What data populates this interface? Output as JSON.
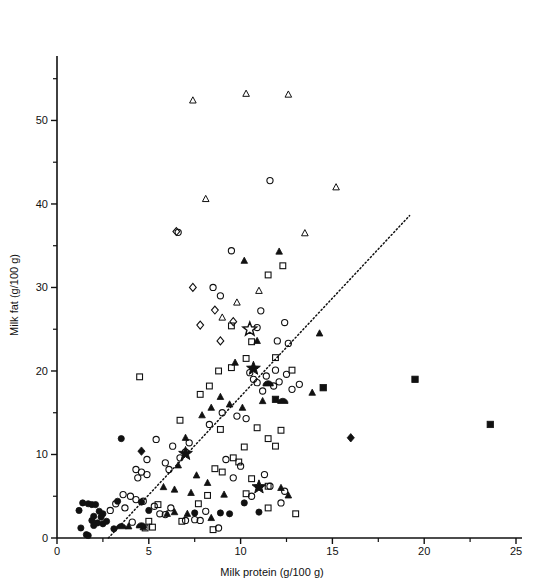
{
  "chart_data": {
    "type": "scatter",
    "title": "",
    "xlabel": "Milk protein (g/100 g)",
    "ylabel": "Milk fat (g/100 g)",
    "xlim": [
      0,
      25
    ],
    "ylim": [
      0,
      57
    ],
    "xticks_major": [
      0,
      5,
      10,
      15,
      20,
      25
    ],
    "xticks_minor": [
      2.5,
      7.5,
      12.5,
      17.5,
      22.5
    ],
    "yticks_major": [
      0,
      10,
      20,
      30,
      40,
      50
    ],
    "yticks_minor": [
      5,
      15,
      25,
      35,
      45,
      55
    ],
    "grid": false,
    "legend": false,
    "annotations": [
      {
        "type": "dotted-line",
        "x1": 2.8,
        "y1": 0.0,
        "x2": 19.2,
        "y2": 38.6
      }
    ],
    "marker_types": [
      "open-circle",
      "filled-circle",
      "open-triangle",
      "filled-triangle",
      "open-square",
      "filled-square",
      "open-diamond",
      "filled-diamond",
      "open-star",
      "filled-star",
      "half-filled-circle"
    ],
    "series": [
      {
        "name": "open-circle",
        "marker": "open-circle",
        "points": [
          [
            11.6,
            42.8
          ],
          [
            9.5,
            34.4
          ],
          [
            6.6,
            36.6
          ],
          [
            11.1,
            27.2
          ],
          [
            12.4,
            25.8
          ],
          [
            8.5,
            30.0
          ],
          [
            8.9,
            29.0
          ],
          [
            12.0,
            23.6
          ],
          [
            12.6,
            23.3
          ],
          [
            10.9,
            25.2
          ],
          [
            11.9,
            20.1
          ],
          [
            12.5,
            19.6
          ],
          [
            12.1,
            18.7
          ],
          [
            11.4,
            19.4
          ],
          [
            11.8,
            18.2
          ],
          [
            13.2,
            18.4
          ],
          [
            12.8,
            17.8
          ],
          [
            10.5,
            19.8
          ],
          [
            10.7,
            19.0
          ],
          [
            10.9,
            18.6
          ],
          [
            11.2,
            17.6
          ],
          [
            9.0,
            15.0
          ],
          [
            9.8,
            14.6
          ],
          [
            8.3,
            13.6
          ],
          [
            10.3,
            14.3
          ],
          [
            7.2,
            11.4
          ],
          [
            6.3,
            11.0
          ],
          [
            7.0,
            10.3
          ],
          [
            6.7,
            9.6
          ],
          [
            5.4,
            11.8
          ],
          [
            4.9,
            9.4
          ],
          [
            5.9,
            9.0
          ],
          [
            6.1,
            8.2
          ],
          [
            4.3,
            8.2
          ],
          [
            4.6,
            7.9
          ],
          [
            4.9,
            7.6
          ],
          [
            4.4,
            7.2
          ],
          [
            9.2,
            9.4
          ],
          [
            10.0,
            8.6
          ],
          [
            9.6,
            7.2
          ],
          [
            11.3,
            7.6
          ],
          [
            11.6,
            6.2
          ],
          [
            10.6,
            5.0
          ],
          [
            12.4,
            5.6
          ],
          [
            3.6,
            5.2
          ],
          [
            4.0,
            5.0
          ],
          [
            4.3,
            4.6
          ],
          [
            4.7,
            4.4
          ],
          [
            3.2,
            4.1
          ],
          [
            3.7,
            3.6
          ],
          [
            2.9,
            3.3
          ],
          [
            5.3,
            3.8
          ],
          [
            6.2,
            3.6
          ],
          [
            7.0,
            2.1
          ],
          [
            7.5,
            2.2
          ],
          [
            7.8,
            2.1
          ],
          [
            5.6,
            2.9
          ],
          [
            5.9,
            2.8
          ],
          [
            8.1,
            3.2
          ],
          [
            12.2,
            4.2
          ],
          [
            4.1,
            1.9
          ],
          [
            8.8,
            1.2
          ]
        ]
      },
      {
        "name": "filled-circle",
        "marker": "filled-circle",
        "points": [
          [
            3.5,
            11.9
          ],
          [
            1.4,
            4.2
          ],
          [
            1.7,
            4.1
          ],
          [
            1.9,
            4.0
          ],
          [
            2.1,
            4.0
          ],
          [
            1.2,
            3.3
          ],
          [
            2.3,
            3.2
          ],
          [
            2.5,
            2.9
          ],
          [
            2.4,
            2.5
          ],
          [
            1.9,
            2.1
          ],
          [
            2.2,
            1.8
          ],
          [
            2.5,
            1.7
          ],
          [
            2.0,
            1.5
          ],
          [
            1.3,
            1.2
          ],
          [
            1.6,
            0.4
          ],
          [
            1.7,
            0.3
          ],
          [
            3.1,
            1.1
          ],
          [
            3.3,
            4.4
          ],
          [
            4.6,
            4.3
          ],
          [
            5.0,
            3.3
          ],
          [
            7.5,
            3.0
          ],
          [
            8.9,
            3.0
          ],
          [
            9.4,
            2.9
          ],
          [
            10.2,
            4.2
          ],
          [
            11.0,
            3.1
          ],
          [
            2.0,
            2.6
          ],
          [
            2.7,
            2.0
          ]
        ]
      },
      {
        "name": "open-triangle",
        "marker": "open-triangle",
        "points": [
          [
            7.4,
            52.4
          ],
          [
            10.3,
            53.2
          ],
          [
            12.6,
            53.1
          ],
          [
            8.1,
            40.6
          ],
          [
            13.5,
            36.5
          ],
          [
            15.2,
            42.0
          ],
          [
            11.0,
            29.6
          ],
          [
            9.8,
            28.2
          ],
          [
            9.0,
            26.4
          ]
        ]
      },
      {
        "name": "filled-triangle",
        "marker": "filled-triangle",
        "points": [
          [
            10.2,
            33.2
          ],
          [
            12.1,
            34.3
          ],
          [
            10.9,
            23.6
          ],
          [
            9.7,
            21.0
          ],
          [
            8.9,
            16.9
          ],
          [
            8.4,
            15.6
          ],
          [
            7.9,
            14.7
          ],
          [
            9.4,
            16.0
          ],
          [
            10.1,
            15.6
          ],
          [
            11.2,
            16.4
          ],
          [
            13.9,
            17.4
          ],
          [
            14.3,
            24.5
          ],
          [
            7.0,
            12.0
          ],
          [
            6.6,
            8.7
          ],
          [
            7.6,
            7.5
          ],
          [
            8.2,
            6.6
          ],
          [
            7.3,
            5.4
          ],
          [
            6.4,
            5.8
          ],
          [
            5.8,
            6.1
          ],
          [
            9.1,
            5.2
          ],
          [
            12.2,
            6.0
          ],
          [
            12.6,
            5.1
          ],
          [
            6.0,
            2.9
          ],
          [
            6.4,
            3.1
          ],
          [
            7.1,
            2.9
          ],
          [
            8.4,
            2.4
          ],
          [
            3.9,
            1.4
          ],
          [
            4.7,
            1.3
          ]
        ]
      },
      {
        "name": "open-square",
        "marker": "open-square",
        "points": [
          [
            11.5,
            31.5
          ],
          [
            12.3,
            32.6
          ],
          [
            9.5,
            25.4
          ],
          [
            10.6,
            23.5
          ],
          [
            4.5,
            19.3
          ],
          [
            8.8,
            20.0
          ],
          [
            9.5,
            20.4
          ],
          [
            10.3,
            21.5
          ],
          [
            11.9,
            21.6
          ],
          [
            12.8,
            20.1
          ],
          [
            7.8,
            17.2
          ],
          [
            8.3,
            18.2
          ],
          [
            6.7,
            14.1
          ],
          [
            8.9,
            13.0
          ],
          [
            10.9,
            13.2
          ],
          [
            12.2,
            12.9
          ],
          [
            11.5,
            11.9
          ],
          [
            11.9,
            11.0
          ],
          [
            10.2,
            10.9
          ],
          [
            9.6,
            9.6
          ],
          [
            9.9,
            9.1
          ],
          [
            8.6,
            8.3
          ],
          [
            9.0,
            7.9
          ],
          [
            10.6,
            7.1
          ],
          [
            11.5,
            6.2
          ],
          [
            10.3,
            5.3
          ],
          [
            8.2,
            5.1
          ],
          [
            7.7,
            4.1
          ],
          [
            5.5,
            4.0
          ],
          [
            5.0,
            2.0
          ],
          [
            6.8,
            2.0
          ],
          [
            11.5,
            3.6
          ],
          [
            13.0,
            2.9
          ],
          [
            5.2,
            1.3
          ],
          [
            4.8,
            1.2
          ],
          [
            8.5,
            1.0
          ]
        ]
      },
      {
        "name": "filled-square",
        "marker": "filled-square",
        "points": [
          [
            14.5,
            18.0
          ],
          [
            19.5,
            19.0
          ],
          [
            23.6,
            13.6
          ],
          [
            11.9,
            16.6
          ]
        ]
      },
      {
        "name": "open-diamond",
        "marker": "open-diamond",
        "points": [
          [
            7.4,
            30.0
          ],
          [
            8.6,
            27.3
          ],
          [
            7.8,
            25.5
          ],
          [
            9.6,
            25.9
          ],
          [
            8.9,
            23.6
          ],
          [
            6.5,
            36.7
          ]
        ]
      },
      {
        "name": "filled-diamond",
        "marker": "filled-diamond",
        "points": [
          [
            4.6,
            10.4
          ],
          [
            16.0,
            12.0
          ]
        ]
      },
      {
        "name": "open-star",
        "marker": "open-star",
        "points": [
          [
            10.5,
            25.0
          ]
        ]
      },
      {
        "name": "filled-star",
        "marker": "filled-star",
        "points": [
          [
            10.7,
            20.3
          ],
          [
            7.0,
            10.1
          ],
          [
            11.0,
            6.1
          ]
        ]
      },
      {
        "name": "half-filled-circle",
        "marker": "half-filled-circle",
        "points": [
          [
            11.5,
            18.4
          ],
          [
            12.3,
            16.3
          ],
          [
            4.6,
            1.4
          ],
          [
            3.5,
            1.3
          ]
        ]
      }
    ]
  },
  "axes": {
    "x_tick_labels": [
      "0",
      "5",
      "10",
      "15",
      "20",
      "25"
    ],
    "y_tick_labels": [
      "0",
      "10",
      "20",
      "30",
      "40",
      "50"
    ],
    "x_axis_title": "Milk protein (g/100 g)",
    "y_axis_title": "Milk fat (g/100 g)"
  }
}
